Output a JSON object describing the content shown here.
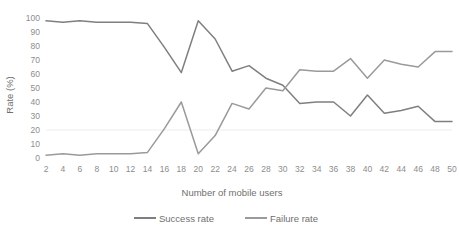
{
  "chart_data": {
    "type": "line",
    "title": "",
    "xlabel": "Number of mobile users",
    "ylabel": "Rate (%)",
    "x": [
      2,
      4,
      6,
      8,
      10,
      12,
      14,
      16,
      18,
      20,
      22,
      24,
      26,
      28,
      30,
      32,
      34,
      36,
      38,
      40,
      42,
      44,
      46,
      48,
      50
    ],
    "xtick_labels": [
      "2",
      "4",
      "6",
      "8",
      "10",
      "12",
      "14",
      "16",
      "18",
      "20",
      "22",
      "24",
      "26",
      "28",
      "30",
      "32",
      "34",
      "36",
      "38",
      "40",
      "42",
      "44",
      "46",
      "48",
      "50"
    ],
    "ytick_labels": [
      "0",
      "10",
      "20",
      "30",
      "40",
      "50",
      "60",
      "70",
      "80",
      "90",
      "100"
    ],
    "yticks": [
      0,
      10,
      20,
      30,
      40,
      50,
      60,
      70,
      80,
      90,
      100
    ],
    "ylim": [
      0,
      100
    ],
    "xlim": [
      2,
      50
    ],
    "grid": "horizontal-faint",
    "legend_position": "bottom-center",
    "series": [
      {
        "name": "Success rate",
        "color": "#7f7f7f",
        "values": [
          98,
          97,
          98,
          97,
          97,
          97,
          96,
          79,
          61,
          98,
          85,
          62,
          66,
          57,
          52,
          39,
          40,
          40,
          30,
          45,
          32,
          34,
          37,
          26,
          26
        ]
      },
      {
        "name": "Failure rate",
        "color": "#9a9a9a",
        "values": [
          2,
          3,
          2,
          3,
          3,
          3,
          4,
          21,
          40,
          3,
          16,
          39,
          35,
          50,
          48,
          63,
          62,
          62,
          71,
          57,
          70,
          67,
          65,
          76,
          76
        ]
      }
    ]
  },
  "legend": {
    "items": [
      {
        "label": "Success rate"
      },
      {
        "label": "Failure rate"
      }
    ]
  },
  "axes": {
    "x_title": "Number of mobile users",
    "y_title": "Rate (%)"
  }
}
